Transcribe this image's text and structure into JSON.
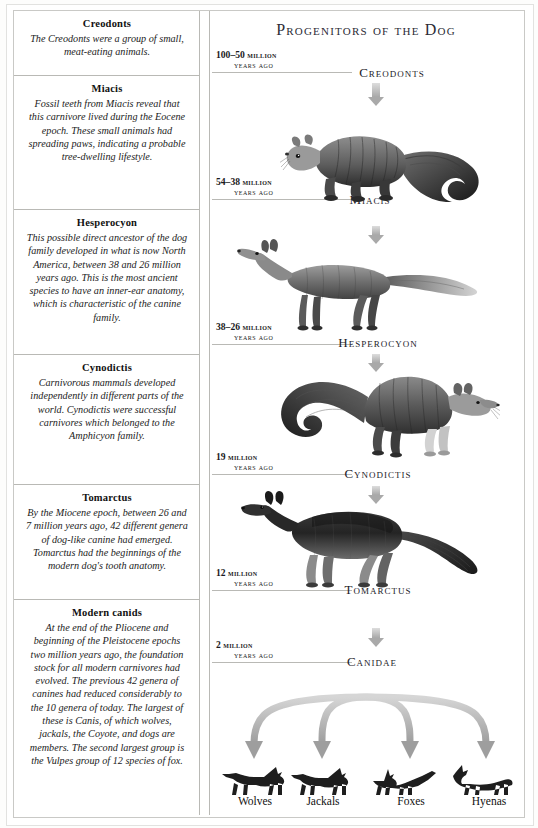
{
  "document": {
    "title": "Progenitors of the Dog"
  },
  "panel": {
    "title": "Progenitors of the Dog"
  },
  "left_column": {
    "entries": [
      {
        "heading": "Creodonts",
        "body": "The Creodonts were a group of small, meat-eating animals."
      },
      {
        "heading": "Miacis",
        "body": "Fossil teeth from Miacis reveal that this carnivore lived during the Eocene epoch. These small animals had spreading paws, indicating a probable tree-dwelling lifestyle."
      },
      {
        "heading": "Hesperocyon",
        "body": "This possible direct ancestor of the dog family developed in what is now North America, between 38 and 26 million years ago. This is the most ancient species to have an inner-ear anatomy, which is characteristic of the canine family."
      },
      {
        "heading": "Cynodictis",
        "body": "Carnivorous mammals developed independently in different parts of the world. Cynodictis were successful carnivores which belonged to the Amphicyon family."
      },
      {
        "heading": "Tomarctus",
        "body": "By the Miocene epoch, between 26 and 7 million years ago, 42 different genera of dog-like canine had emerged. Tomarctus had the beginnings of the modern dog's tooth anatomy."
      },
      {
        "heading": "Modern canids",
        "body": "At the end of the Pliocene and beginning of the Pleistocene epochs two million years ago, the foundation stock for all modern carnivores had evolved. The previous 42 genera of canines had reduced considerably to the 10 genera of today. The largest of these is Canis, of which wolves, jackals, the Coyote, and dogs are members. The second largest group is the Vulpes group of 12 species of fox."
      }
    ]
  },
  "timeline": {
    "eras": [
      {
        "range": "100–50",
        "unit": "million",
        "suffix": "years ago"
      },
      {
        "range": "54–38",
        "unit": "million",
        "suffix": "years ago"
      },
      {
        "range": "38–26",
        "unit": "million",
        "suffix": "years ago"
      },
      {
        "range": "19",
        "unit": "million",
        "suffix": "years ago"
      },
      {
        "range": "12",
        "unit": "million",
        "suffix": "years ago"
      },
      {
        "range": "2",
        "unit": "million",
        "suffix": "years ago"
      }
    ],
    "species": [
      {
        "name": "Creodonts"
      },
      {
        "name": "Miacis"
      },
      {
        "name": "Hesperocyon"
      },
      {
        "name": "Cynodictis"
      },
      {
        "name": "Tomarctus"
      },
      {
        "name": "Canidae"
      }
    ]
  },
  "descendants": {
    "labels": [
      "Wolves",
      "Jackals",
      "Foxes",
      "Hyenas"
    ]
  },
  "colors": {
    "arrow": "#a9a9a9",
    "rule": "#b9b9b5",
    "heading_text": "#1b1b28",
    "body_text": "#1b1b1b"
  }
}
